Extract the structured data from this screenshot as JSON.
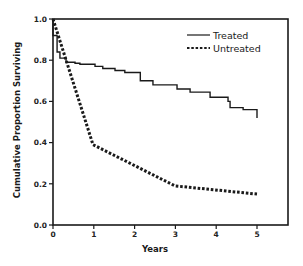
{
  "chart_data": {
    "type": "line",
    "title": "",
    "xlabel": "Years",
    "ylabel": "Cumulative Proportion Surviving",
    "xlim": [
      0,
      5
    ],
    "ylim": [
      0.0,
      1.0
    ],
    "x_ticks": [
      "0",
      "1",
      "2",
      "3",
      "4",
      "5"
    ],
    "y_ticks": [
      "0.0",
      "0.2",
      "0.4",
      "0.6",
      "0.8",
      "1.0"
    ],
    "grid": false,
    "legend_position": "upper right",
    "series": [
      {
        "name": "Treated",
        "style": "solid",
        "x": [
          0.0,
          0.0,
          0.02,
          0.1,
          0.17,
          0.32,
          0.54,
          0.66,
          1.03,
          1.22,
          1.52,
          1.76,
          2.14,
          2.45,
          2.75,
          3.04,
          3.36,
          3.72,
          3.85,
          4.14,
          4.29,
          4.34,
          4.64,
          4.66,
          5.0,
          5.0
        ],
        "values": [
          1.0,
          0.92,
          0.92,
          0.84,
          0.81,
          0.79,
          0.785,
          0.78,
          0.77,
          0.76,
          0.75,
          0.74,
          0.7,
          0.68,
          0.68,
          0.66,
          0.645,
          0.645,
          0.62,
          0.62,
          0.6,
          0.57,
          0.57,
          0.56,
          0.56,
          0.52
        ]
      },
      {
        "name": "Untreated",
        "style": "dashed",
        "x": [
          0.0,
          0.98,
          2.99,
          5.0
        ],
        "values": [
          1.0,
          0.39,
          0.19,
          0.15
        ]
      }
    ]
  },
  "legend": {
    "items": [
      {
        "label": "Treated",
        "style": "solid"
      },
      {
        "label": "Untreated",
        "style": "dashed"
      }
    ]
  },
  "axes": {
    "x_title": "Years",
    "y_title": "Cumulative Proportion Surviving"
  },
  "colors": {
    "line": "#1a1a1a",
    "axis": "#1a1a1a",
    "background": "#ffffff"
  }
}
